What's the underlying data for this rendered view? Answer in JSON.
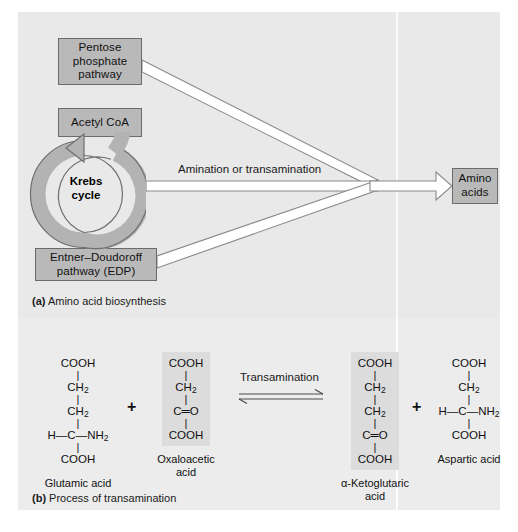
{
  "figure": {
    "panel_a": {
      "caption_label": "(a)",
      "caption_text": " Amino acid biosynthesis",
      "boxes": [
        {
          "id": "pentose",
          "label": "Pentose phosphate pathway"
        },
        {
          "id": "acetyl",
          "label": "Acetyl CoA"
        },
        {
          "id": "edp",
          "label": "Entner–Doudoroff pathway (EDP)"
        },
        {
          "id": "amino",
          "label": "Amino acids"
        }
      ],
      "cycle_label_line1": "Krebs",
      "cycle_label_line2": "cycle",
      "arrow_label": "Amination or transamination"
    },
    "panel_b": {
      "caption_label": "(b)",
      "caption_text": " Process of transamination",
      "reaction_label": "Transamination",
      "plus_symbol": "+",
      "equilibrium_symbol": "⇌",
      "compounds": [
        {
          "id": "glutamic",
          "name_line1": "Glutamic acid",
          "name_line2": "",
          "shaded": false,
          "rows": [
            "COOH",
            "CH2",
            "CH2",
            "H—C—NH2",
            "COOH"
          ],
          "display": [
            {
              "text": "COOH",
              "sub": ""
            },
            {
              "bond": "|"
            },
            {
              "text": "CH",
              "sub": "2"
            },
            {
              "bond": "|"
            },
            {
              "text": "CH",
              "sub": "2"
            },
            {
              "bond": "|"
            },
            {
              "text": "H—C—NH",
              "sub": "2"
            },
            {
              "bond": "|"
            },
            {
              "text": "COOH",
              "sub": ""
            }
          ]
        },
        {
          "id": "oxaloacetic",
          "name_line1": "Oxaloacetic",
          "name_line2": "acid",
          "shaded": true,
          "rows": [
            "COOH",
            "CH2",
            "C=O",
            "COOH"
          ],
          "display": [
            {
              "text": "COOH",
              "sub": ""
            },
            {
              "bond": "|"
            },
            {
              "text": "CH",
              "sub": "2"
            },
            {
              "bond": "|"
            },
            {
              "text": "C═O",
              "sub": ""
            },
            {
              "bond": "|"
            },
            {
              "text": "COOH",
              "sub": ""
            }
          ]
        },
        {
          "id": "ketoglutaric",
          "name_line1": "α-Ketoglutaric",
          "name_line2": "acid",
          "shaded": true,
          "rows": [
            "COOH",
            "CH2",
            "CH2",
            "C=O",
            "COOH"
          ],
          "display": [
            {
              "text": "COOH",
              "sub": ""
            },
            {
              "bond": "|"
            },
            {
              "text": "CH",
              "sub": "2"
            },
            {
              "bond": "|"
            },
            {
              "text": "CH",
              "sub": "2"
            },
            {
              "bond": "|"
            },
            {
              "text": "C═O",
              "sub": ""
            },
            {
              "bond": "|"
            },
            {
              "text": "COOH",
              "sub": ""
            }
          ]
        },
        {
          "id": "aspartic",
          "name_line1": "Aspartic acid",
          "name_line2": "",
          "shaded": false,
          "rows": [
            "COOH",
            "CH2",
            "H—C—NH2",
            "COOH"
          ],
          "display": [
            {
              "text": "COOH",
              "sub": ""
            },
            {
              "bond": "|"
            },
            {
              "text": "CH",
              "sub": "2"
            },
            {
              "bond": "|"
            },
            {
              "text": "H—C—NH",
              "sub": "2"
            },
            {
              "bond": "|"
            },
            {
              "text": "COOH",
              "sub": ""
            }
          ]
        }
      ]
    },
    "colors": {
      "page_background": "#ffffff",
      "panel_background": "#e9e9e9",
      "panel_b_background": "#ececec",
      "box_fill": "#b9b9b9",
      "box_border": "#6b6b6b",
      "ring_fill": "#b3b3b3",
      "ring_stroke": "#6f6f6f",
      "arrow_fill": "#ffffff",
      "arrow_stroke": "#8a8a8a",
      "structure_shade": "#dcdcdc",
      "text": "#111111"
    }
  }
}
